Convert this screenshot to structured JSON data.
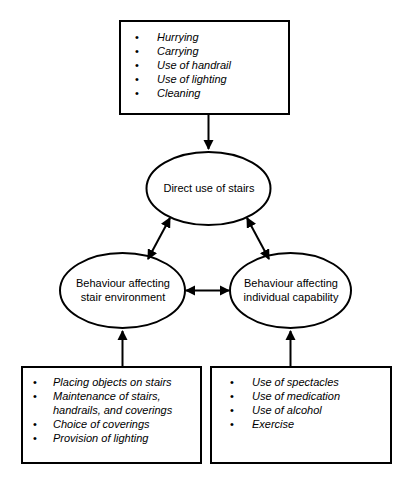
{
  "diagram": {
    "colors": {
      "stroke": "#000000",
      "background": "#ffffff",
      "text": "#000000"
    },
    "top_box": {
      "items": [
        "Hurrying",
        "Carrying",
        "Use of handrail",
        "Use of lighting",
        "Cleaning"
      ]
    },
    "ellipses": {
      "direct": "Direct use of stairs",
      "environment": "Behaviour affecting\nstair environment",
      "capability": "Behaviour affecting\nindividual capability"
    },
    "bottom_left_box": {
      "items": [
        "Placing objects on stairs",
        "Maintenance of stairs,\nhandrails, and coverings",
        "Choice of coverings",
        "Provision of lighting"
      ]
    },
    "bottom_right_box": {
      "items": [
        "Use of spectacles",
        "Use of medication",
        "Use of alcohol",
        "Exercise"
      ]
    }
  }
}
